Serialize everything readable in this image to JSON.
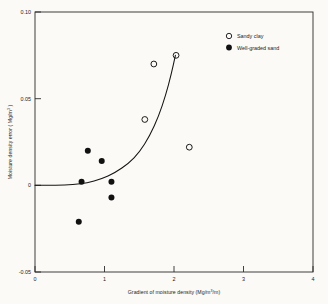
{
  "chart_data": {
    "type": "scatter",
    "title": "",
    "xlabel": "Gradient of moisture density (Mg/m3/m)",
    "ylabel": "Moisture density error ( Mg/m3 )",
    "xlim": [
      0,
      4
    ],
    "ylim": [
      -0.05,
      0.1
    ],
    "xticks": [
      0,
      1,
      2,
      3,
      4
    ],
    "xtick_labels": [
      "0",
      "1",
      "2",
      "3",
      "4"
    ],
    "yticks": [
      -0.05,
      0,
      0.05,
      0.1
    ],
    "ytick_labels": [
      "-0.05",
      "0",
      "0.05",
      "0.10"
    ],
    "grid": false,
    "legend_position": "top-right",
    "series": [
      {
        "name": "Sandy clay",
        "marker": "open-circle",
        "color": "#111111",
        "points": [
          {
            "x": 1.58,
            "y": 0.038
          },
          {
            "x": 1.71,
            "y": 0.07
          },
          {
            "x": 2.03,
            "y": 0.075
          },
          {
            "x": 2.22,
            "y": 0.022
          }
        ]
      },
      {
        "name": "Well-graded sand",
        "marker": "filled-circle",
        "color": "#111111",
        "points": [
          {
            "x": 0.63,
            "y": -0.021
          },
          {
            "x": 0.67,
            "y": 0.002
          },
          {
            "x": 0.76,
            "y": 0.02
          },
          {
            "x": 0.96,
            "y": 0.014
          },
          {
            "x": 1.1,
            "y": 0.002
          },
          {
            "x": 1.1,
            "y": -0.007
          }
        ]
      }
    ],
    "fit_curve": {
      "name": "fitted trend",
      "points": [
        {
          "x": 0.0,
          "y": 0.0
        },
        {
          "x": 0.3,
          "y": 0.0001
        },
        {
          "x": 0.55,
          "y": 0.0004
        },
        {
          "x": 0.75,
          "y": 0.0014
        },
        {
          "x": 0.95,
          "y": 0.0036
        },
        {
          "x": 1.15,
          "y": 0.0072
        },
        {
          "x": 1.35,
          "y": 0.0128
        },
        {
          "x": 1.5,
          "y": 0.019
        },
        {
          "x": 1.65,
          "y": 0.0285
        },
        {
          "x": 1.78,
          "y": 0.04
        },
        {
          "x": 1.88,
          "y": 0.052
        },
        {
          "x": 1.96,
          "y": 0.064
        },
        {
          "x": 2.02,
          "y": 0.075
        }
      ]
    }
  },
  "axes": {
    "xlabel_parts": {
      "pre": "Gradient of moisture density (Mg/m",
      "sup": "3",
      "post": "/m)"
    },
    "ylabel_parts": {
      "pre": "Moisture density  error  ( Mg/m",
      "sup": "3",
      "post": " )"
    }
  },
  "legend": {
    "entries": [
      {
        "label": "Sandy clay",
        "marker": "open-circle"
      },
      {
        "label": "Well-graded sand",
        "marker": "filled-circle"
      }
    ]
  },
  "colors": {
    "ink": "#1a1a1a",
    "axis": "#2b2b2b",
    "curve": "#141414",
    "background": "#fbfaf7"
  }
}
